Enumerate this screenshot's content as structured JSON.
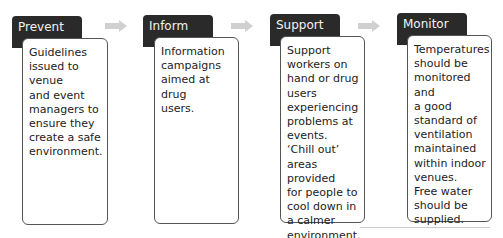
{
  "stages": [
    {
      "title": "Prevent",
      "text": "Guidelines\nissued to venue\nand event\nmanagers to\nensure they\ncreate a safe\nenvironment."
    },
    {
      "title": "Inform",
      "text": "Information\ncampaigns\naimed at drug\nusers."
    },
    {
      "title": "Support",
      "text": "Support\nworkers on\nhand or drug\nusers\nexperiencing\nproblems at\nevents.\n‘Chill out’\nareas provided\nfor people to\ncool down in\na calmer\nenvironment."
    },
    {
      "title": "Monitor",
      "text": "Temperatures\nshould be\nmonitored and\na good\nstandard of\nventilation\nmaintained\nwithin indoor\nvenues.\nFree water\nshould be\nsupplied."
    }
  ],
  "colors": {
    "header_bg": "#2a2a2a",
    "header_text": "#f2f2f2",
    "arrow": "#d0d0d0",
    "border": "#555555"
  }
}
